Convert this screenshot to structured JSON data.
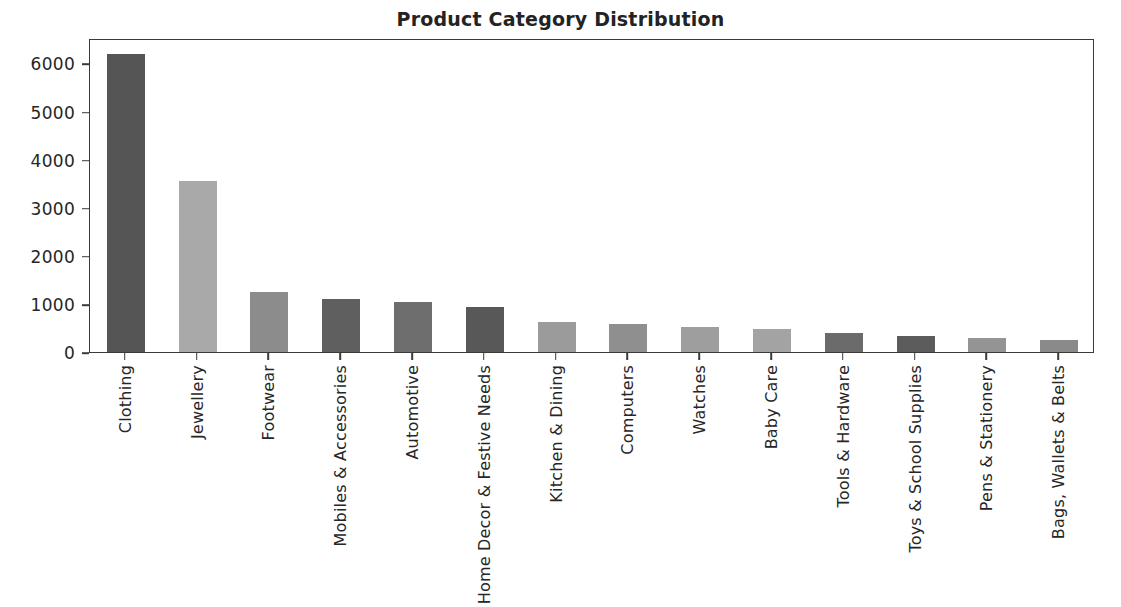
{
  "chart_data": {
    "type": "bar",
    "title": "Product Category Distribution",
    "xlabel": "",
    "ylabel": "",
    "categories": [
      "Clothing",
      "Jewellery",
      "Footwear",
      "Mobiles & Accessories",
      "Automotive",
      "Home Decor & Festive Needs",
      "Kitchen & Dining",
      "Computers",
      "Watches",
      "Baby Care",
      "Tools & Hardware",
      "Toys & School Supplies",
      "Pens & Stationery",
      "Bags, Wallets & Belts"
    ],
    "values": [
      6200,
      3550,
      1250,
      1100,
      1040,
      930,
      630,
      580,
      520,
      480,
      390,
      330,
      290,
      260
    ],
    "bar_colors": [
      "#555555",
      "#a9a9a9",
      "#8c8c8c",
      "#5f5f5f",
      "#6e6e6e",
      "#585858",
      "#9b9b9b",
      "#8f8f8f",
      "#9e9e9e",
      "#a3a3a3",
      "#6b6b6b",
      "#5c5c5c",
      "#949494",
      "#8a8a8a"
    ],
    "ylim": [
      0,
      6530
    ],
    "yticks": [
      0,
      1000,
      2000,
      3000,
      4000,
      5000,
      6000
    ],
    "ytick_labels": [
      "0",
      "1000",
      "2000",
      "3000",
      "4000",
      "5000",
      "6000"
    ],
    "grid": false,
    "legend": null,
    "tick_label_rotation": 90,
    "axis_color": "#3a3a3a",
    "background_color": "#ffffff"
  }
}
